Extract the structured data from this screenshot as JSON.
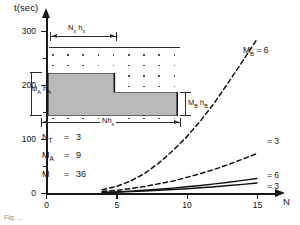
{
  "figure": {
    "caption": "Fig. ...",
    "axes": {
      "ylabel": "t(sec)",
      "xlabel": "N",
      "yticks": [
        "0",
        "100",
        "200",
        "300"
      ],
      "xticks": [
        "0",
        "5",
        "10",
        "15"
      ],
      "ylim": [
        0,
        330
      ],
      "xlim": [
        0,
        16.5
      ]
    },
    "inset": {
      "top_label_main": "N",
      "top_label_sub": "x",
      "top_label_main2": "h",
      "top_label_sub2": "x",
      "left_label_main": "M",
      "left_label_sub": "A",
      "left_label_main2": "h",
      "left_label_sub2": "A",
      "right_label_main": "M",
      "right_label_sub": "B",
      "right_label_main2": "h",
      "right_label_sub2": "B",
      "bottom_label_main": "Nh",
      "bottom_label_sub": "x"
    },
    "parameters": [
      {
        "name": "N",
        "sub": "T",
        "eq": "=",
        "value": "3"
      },
      {
        "name": "M",
        "sub": "A",
        "eq": "=",
        "value": "9"
      },
      {
        "name": "M",
        "sub": "",
        "eq": "=",
        "value": "36"
      }
    ],
    "curve_labels": [
      {
        "name": "M",
        "sub": "B",
        "eq": "= 6"
      },
      {
        "name": "",
        "sub": "",
        "eq": "= 3"
      },
      {
        "name": "",
        "sub": "",
        "eq": "= 6"
      },
      {
        "name": "",
        "sub": "",
        "eq": "= 3"
      }
    ]
  },
  "chart_data": {
    "type": "line",
    "title": "",
    "xlabel": "N",
    "ylabel": "t(sec)",
    "xlim": [
      0,
      16.5
    ],
    "ylim": [
      0,
      330
    ],
    "grid": false,
    "legend": "inline-right-of-curve-ends",
    "xticks": [
      0,
      5,
      10,
      15
    ],
    "yticks": [
      0,
      100,
      200,
      300
    ],
    "annotations": [
      "N_T = 3",
      "M_A = 9",
      "M = 36"
    ],
    "series": [
      {
        "name": "M_B = 6",
        "style": "dashed",
        "color": "#111111",
        "x": [
          4,
          5,
          6,
          7,
          8,
          9,
          10,
          11,
          12,
          13,
          14,
          15
        ],
        "y": [
          6,
          12,
          22,
          36,
          55,
          78,
          104,
          134,
          168,
          206,
          245,
          285
        ]
      },
      {
        "name": "= 3",
        "style": "dashed",
        "color": "#111111",
        "x": [
          4,
          5,
          6,
          7,
          8,
          9,
          10,
          11,
          12,
          13,
          14,
          15
        ],
        "y": [
          3,
          5,
          8,
          12,
          17,
          22,
          29,
          36,
          44,
          53,
          63,
          73
        ]
      },
      {
        "name": "= 6",
        "style": "solid",
        "color": "#111111",
        "x": [
          4,
          5,
          6,
          7,
          8,
          9,
          10,
          11,
          12,
          13,
          14,
          15
        ],
        "y": [
          1,
          2,
          3.5,
          5,
          7,
          9,
          11.5,
          14,
          17,
          20,
          23.5,
          27
        ]
      },
      {
        "name": "= 3",
        "style": "solid",
        "color": "#111111",
        "x": [
          4,
          5,
          6,
          7,
          8,
          9,
          10,
          11,
          12,
          13,
          14,
          15
        ],
        "y": [
          0.8,
          1.5,
          2.5,
          3.6,
          5,
          6.4,
          8,
          9.8,
          11.7,
          13.8,
          16,
          18.5
        ]
      }
    ]
  }
}
